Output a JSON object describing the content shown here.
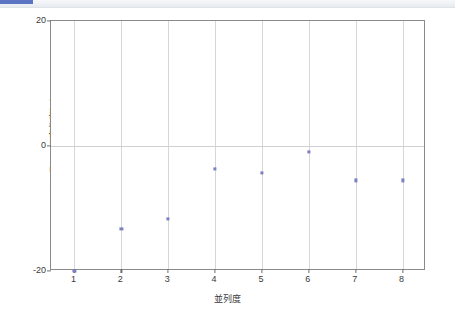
{
  "chrome": {
    "progress_color": "#5b74c4"
  },
  "chart_data": {
    "type": "scatter",
    "title": "",
    "subtitle": "",
    "xlabel": "並列度",
    "ylabel": "レイテンシの変化率[%]",
    "x": [
      1,
      2,
      3,
      4,
      5,
      6,
      7,
      8
    ],
    "values": [
      -20.0,
      -13.3,
      -11.7,
      -3.7,
      -4.3,
      -0.9,
      -5.5,
      -5.5
    ],
    "series": [
      {
        "name": "レイテンシの変化率",
        "color": "#7b7fc4",
        "values": [
          -20.0,
          -13.3,
          -11.7,
          -3.7,
          -4.3,
          -0.9,
          -5.5,
          -5.5
        ]
      }
    ],
    "xlim": [
      0.5,
      8.5
    ],
    "ylim": [
      -20,
      20
    ],
    "xticks": [
      1,
      2,
      3,
      4,
      5,
      6,
      7,
      8
    ],
    "xtick_labels": [
      "1",
      "2",
      "3",
      "4",
      "5",
      "6",
      "7",
      "8"
    ],
    "yticks": [
      -20,
      0,
      20
    ],
    "ytick_labels": [
      "-20",
      "0",
      "20"
    ],
    "grid": "vertical-and-zero-line",
    "legend": "none",
    "marker": "square",
    "marker_color": "#7b7fc4"
  }
}
